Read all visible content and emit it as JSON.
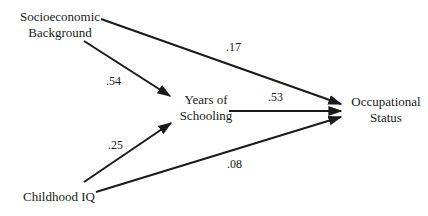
{
  "diagram": {
    "type": "path-diagram",
    "nodes": {
      "ses": {
        "line1": "Socioeconomic",
        "line2": "Background"
      },
      "school": {
        "line1": "Years of",
        "line2": "Schooling"
      },
      "occ": {
        "line1": "Occupational",
        "line2": "Status"
      },
      "iq": {
        "line1": "Childhood IQ"
      }
    },
    "edges": [
      {
        "from": "ses",
        "to": "occ",
        "coefficient": ".17"
      },
      {
        "from": "ses",
        "to": "school",
        "coefficient": ".54"
      },
      {
        "from": "school",
        "to": "occ",
        "coefficient": ".53"
      },
      {
        "from": "iq",
        "to": "school",
        "coefficient": ".25"
      },
      {
        "from": "iq",
        "to": "occ",
        "coefficient": ".08"
      }
    ],
    "line_color": "#1a1a1a"
  }
}
